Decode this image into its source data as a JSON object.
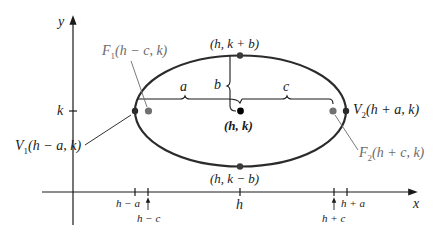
{
  "diagram": {
    "type": "ellipse-with-horizontal-major-axis",
    "axes": {
      "x_label": "x",
      "y_label": "y"
    },
    "center": {
      "label": "(h, k)"
    },
    "top_vertex": {
      "label": "(h, k + b)"
    },
    "bottom_vertex": {
      "label": "(h, k − b)"
    },
    "vertex_left": {
      "label": "V",
      "sub": "1",
      "coords": "(h − a, k)"
    },
    "vertex_right": {
      "label": "V",
      "sub": "2",
      "coords": "(h + a, k)"
    },
    "focus_left": {
      "label": "F",
      "sub": "1",
      "coords": "(h − c, k)"
    },
    "focus_right": {
      "label": "F",
      "sub": "2",
      "coords": "(h + c, k)"
    },
    "braces": {
      "a": "a",
      "b": "b",
      "c": "c"
    },
    "y_tick": "k",
    "x_ticks": {
      "h_minus_a": "h − a",
      "h_minus_c": "h − c",
      "h": "h",
      "h_plus_c": "h + c",
      "h_plus_a": "h + a"
    },
    "colors": {
      "curve": "#2b2b2b",
      "focus": "#707070",
      "text": "#1a1a1a",
      "label_grey": "#6b6b6b"
    }
  }
}
